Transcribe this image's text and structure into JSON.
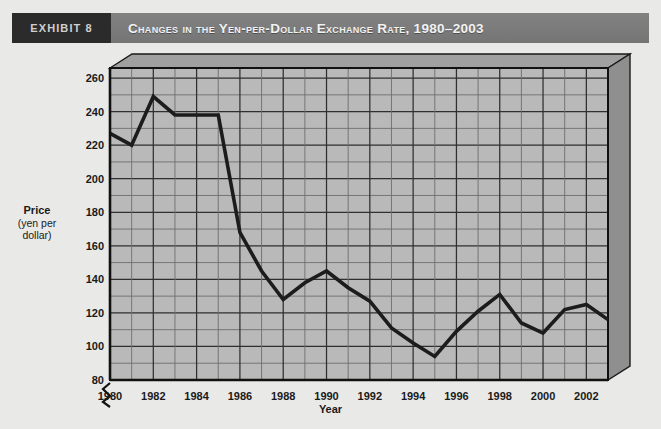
{
  "header": {
    "exhibit_tag": "EXHIBIT 8",
    "title": "Changes in the Yen-per-Dollar Exchange Rate, 1980–2003",
    "band_color": "#7c7c7c",
    "tag_color": "#2b2b2b",
    "title_color": "#f2f2f2"
  },
  "colors": {
    "page_background": "#e9e9e7",
    "plot_background": "#b9b9b9",
    "plot_top_face": "#a0a0a0",
    "plot_right_face": "#8f8f8f",
    "gridline_major": "#2f2f2f",
    "gridline_minor": "#6e6e6e",
    "axis": "#111111",
    "series_line": "#1c1c1c",
    "tick_text": "#1a1a1a"
  },
  "chart_data": {
    "type": "line",
    "title": "Changes in the Yen-per-Dollar Exchange Rate, 1980–2003",
    "xlabel": "Year",
    "ylabel": "Price (yen per dollar)",
    "ylabel_main": "Price",
    "ylabel_sub": "(yen per dollar)",
    "ylim": [
      80,
      266
    ],
    "y_axis_break": true,
    "y_ticks": [
      80,
      100,
      120,
      140,
      160,
      180,
      200,
      220,
      240,
      260
    ],
    "y_minor_step": 10,
    "xlim": [
      1980,
      2003
    ],
    "x_ticks": [
      1980,
      1982,
      1984,
      1986,
      1988,
      1990,
      1992,
      1994,
      1996,
      1998,
      2000,
      2002
    ],
    "x_minor_step": 1,
    "grid": true,
    "legend": null,
    "x": [
      1980,
      1981,
      1982,
      1983,
      1984,
      1985,
      1986,
      1987,
      1988,
      1989,
      1990,
      1991,
      1992,
      1993,
      1994,
      1995,
      1996,
      1997,
      1998,
      1999,
      2000,
      2001,
      2002,
      2003
    ],
    "values": [
      227,
      220,
      249,
      238,
      238,
      238,
      168,
      145,
      128,
      138,
      145,
      135,
      127,
      111,
      102,
      94,
      109,
      121,
      131,
      114,
      108,
      122,
      125,
      116
    ],
    "series": [
      {
        "name": "Yen per dollar",
        "values": [
          227,
          220,
          249,
          238,
          238,
          238,
          168,
          145,
          128,
          138,
          145,
          135,
          127,
          111,
          102,
          94,
          109,
          121,
          131,
          114,
          108,
          122,
          125,
          116
        ]
      }
    ]
  }
}
